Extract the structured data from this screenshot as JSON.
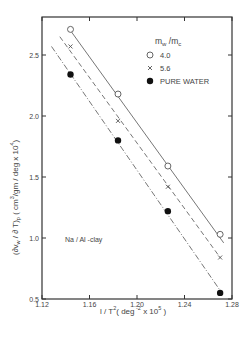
{
  "chart_data": {
    "type": "scatter",
    "title": "",
    "xlabel": "1/T² (deg⁻² x 10⁵)",
    "ylabel": "(∂v_w/∂T)_p   (cm³/gm/deg x 10⁴)",
    "xlim": [
      1.12,
      1.28
    ],
    "ylim": [
      0.5,
      2.8
    ],
    "x_ticks": [
      1.12,
      1.16,
      1.2,
      1.24,
      1.28
    ],
    "x_tick_labels": [
      "1.12",
      "1.16",
      "1.20",
      "1.24",
      "1.28"
    ],
    "y_ticks": [
      0.5,
      1.0,
      1.5,
      2.0,
      2.5
    ],
    "y_tick_labels": [
      "0.5",
      "1.0",
      "1.5",
      "2.0",
      "2.5"
    ],
    "grid": false,
    "legend_title": "m_w / m_c",
    "legend_position": "upper right",
    "annotation": "Na / Al -clay",
    "x": [
      1.144,
      1.184,
      1.226,
      1.27
    ],
    "series": [
      {
        "name": "4.0",
        "marker": "open-circle",
        "line": "solid",
        "values": [
          2.71,
          2.18,
          1.59,
          1.03
        ],
        "fit": {
          "x": [
            1.144,
            1.273
          ],
          "y": [
            2.7,
            0.96
          ]
        }
      },
      {
        "name": "5.6",
        "marker": "cross",
        "line": "dashed",
        "values": [
          2.57,
          1.96,
          1.42,
          0.84
        ],
        "fit": {
          "x": [
            1.135,
            1.27
          ],
          "y": [
            2.65,
            0.84
          ]
        }
      },
      {
        "name": "PURE WATER",
        "marker": "filled-circle",
        "line": "dash-dot",
        "values": [
          2.34,
          1.8,
          1.22,
          0.55
        ],
        "fit": {
          "x": [
            1.128,
            1.27
          ],
          "y": [
            2.57,
            0.57
          ]
        }
      }
    ]
  }
}
